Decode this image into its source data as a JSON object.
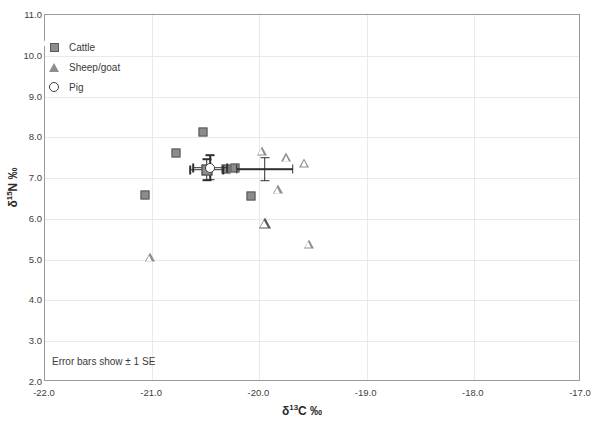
{
  "chart_data": {
    "type": "scatter",
    "title": "",
    "xlabel": "δ13C ‰",
    "ylabel": "δ15N ‰",
    "xlabel_parts": {
      "delta": "δ",
      "sup": "13",
      "element": "C ‰"
    },
    "ylabel_parts": {
      "delta": "δ",
      "sup": "15",
      "element": "N ‰"
    },
    "xlim": [
      -22.0,
      -17.0
    ],
    "ylim": [
      2.0,
      11.0
    ],
    "xticks": [
      "-22.0",
      "-21.0",
      "-20.0",
      "-19.0",
      "-18.0",
      "-17.0"
    ],
    "xtick_values": [
      -22.0,
      -21.0,
      -20.0,
      -19.0,
      -18.0,
      -17.0
    ],
    "yticks": [
      "2.0",
      "3.0",
      "4.0",
      "5.0",
      "6.0",
      "7.0",
      "8.0",
      "9.0",
      "10.0",
      "11.0"
    ],
    "ytick_values": [
      2.0,
      3.0,
      4.0,
      5.0,
      6.0,
      7.0,
      8.0,
      9.0,
      10.0,
      11.0
    ],
    "grid": true,
    "legend_position": "top-left",
    "annotation": "Error bars show ± 1 SE",
    "series": [
      {
        "name": "Cattle",
        "marker": "filled-square",
        "color": "#8c8c8c",
        "points": [
          {
            "x": -20.53,
            "y": 8.12
          },
          {
            "x": -20.78,
            "y": 7.62
          },
          {
            "x": -21.07,
            "y": 6.58
          },
          {
            "x": -20.08,
            "y": 6.57
          },
          {
            "x": -20.31,
            "y": 7.22
          },
          {
            "x": -20.23,
            "y": 7.25
          }
        ],
        "mean": {
          "x": -20.49,
          "y": 7.21
        },
        "se_x": 0.155,
        "se_y": 0.26
      },
      {
        "name": "Sheep/goat",
        "marker": "open-triangle",
        "color": "#8e8e8e",
        "points": [
          {
            "x": -19.98,
            "y": 7.67
          },
          {
            "x": -19.75,
            "y": 7.73
          },
          {
            "x": -19.58,
            "y": 7.82
          },
          {
            "x": -19.83,
            "y": 7.39
          },
          {
            "x": -19.54,
            "y": 6.27
          },
          {
            "x": -21.02,
            "y": 6.16
          }
        ],
        "mean": {
          "x": -19.95,
          "y": 7.22
        },
        "se_x": 0.26,
        "se_y": 0.28
      },
      {
        "name": "Pig",
        "marker": "open-circle",
        "color": "#3f3f3f",
        "points": [],
        "mean": {
          "x": -20.46,
          "y": 7.26
        },
        "se_x": 0.16,
        "se_y": 0.3
      }
    ]
  },
  "legend": {
    "items": [
      {
        "label": "Cattle",
        "marker": "filled-square"
      },
      {
        "label": "Sheep/goat",
        "marker": "open-triangle"
      },
      {
        "label": "Pig",
        "marker": "open-circle"
      }
    ]
  }
}
